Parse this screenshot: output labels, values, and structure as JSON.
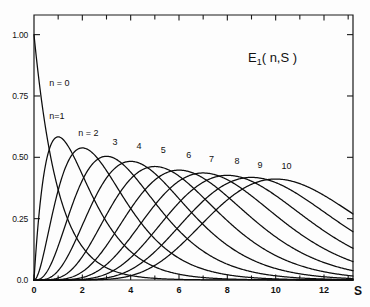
{
  "chart_data": {
    "type": "line",
    "title_base": "E",
    "title_sub": "1",
    "title_rest": "( n,S )",
    "xlabel": "S",
    "ylabel": "",
    "xlim": [
      0,
      13.2
    ],
    "ylim": [
      0.0,
      1.08
    ],
    "grid": false,
    "legend": "inline-curve-labels",
    "x_ticks": [
      0,
      2,
      4,
      6,
      8,
      10,
      12
    ],
    "x_tick_labels": [
      "0",
      "2",
      "4",
      "6",
      "8",
      "10",
      "12"
    ],
    "x_minor_ticks": [
      1,
      2,
      3,
      4,
      5,
      6,
      7,
      8,
      9,
      10,
      11,
      12,
      13
    ],
    "y_ticks": [
      0.0,
      0.25,
      0.5,
      0.75,
      1.0
    ],
    "y_tick_labels": [
      "0.0",
      "0.25",
      "0.50",
      "0.75",
      "1.00"
    ],
    "formula": "E1(n,S) = S^n * exp(-S) / n!",
    "series": [
      {
        "name": "n = 0",
        "n": 0,
        "label": "n = 0",
        "peak_x": 0.0,
        "peak_y": 1.0,
        "label_x": 1.05,
        "label_y": 0.79
      },
      {
        "name": "n = 1",
        "n": 1,
        "label": "n=1",
        "peak_x": 1.0,
        "peak_y": 0.5833,
        "label_x": 0.95,
        "label_y": 0.655
      },
      {
        "name": "n = 2",
        "n": 2,
        "label": "n = 2",
        "peak_x": 2.0,
        "peak_y": 0.5383,
        "label_x": 2.25,
        "label_y": 0.585
      },
      {
        "name": "n = 3",
        "n": 3,
        "label": "3",
        "peak_x": 3.0,
        "peak_y": 0.5042,
        "label_x": 3.35,
        "label_y": 0.552
      },
      {
        "name": "n = 4",
        "n": 4,
        "label": "4",
        "peak_x": 4.0,
        "peak_y": 0.4835,
        "label_x": 4.35,
        "label_y": 0.535
      },
      {
        "name": "n = 5",
        "n": 5,
        "label": "5",
        "peak_x": 5.0,
        "peak_y": 0.4626,
        "label_x": 5.35,
        "label_y": 0.518
      },
      {
        "name": "n = 6",
        "n": 6,
        "label": "6",
        "peak_x": 6.0,
        "peak_y": 0.4477,
        "label_x": 6.4,
        "label_y": 0.498
      },
      {
        "name": "n = 7",
        "n": 7,
        "label": "7",
        "peak_x": 7.0,
        "peak_y": 0.4362,
        "label_x": 7.35,
        "label_y": 0.482
      },
      {
        "name": "n = 8",
        "n": 8,
        "label": "8",
        "peak_x": 8.0,
        "peak_y": 0.4266,
        "label_x": 8.4,
        "label_y": 0.472
      },
      {
        "name": "n = 9",
        "n": 9,
        "label": "9",
        "peak_x": 9.0,
        "peak_y": 0.4182,
        "label_x": 9.35,
        "label_y": 0.458
      },
      {
        "name": "n = 10",
        "n": 10,
        "label": "10",
        "peak_x": 10.0,
        "peak_y": 0.4115,
        "label_x": 10.45,
        "label_y": 0.452
      }
    ],
    "axis_colors": {
      "frame": "#1a1a1a",
      "curve": "#0d0d0d",
      "text": "#111111",
      "background": "#fdfdfd"
    }
  }
}
